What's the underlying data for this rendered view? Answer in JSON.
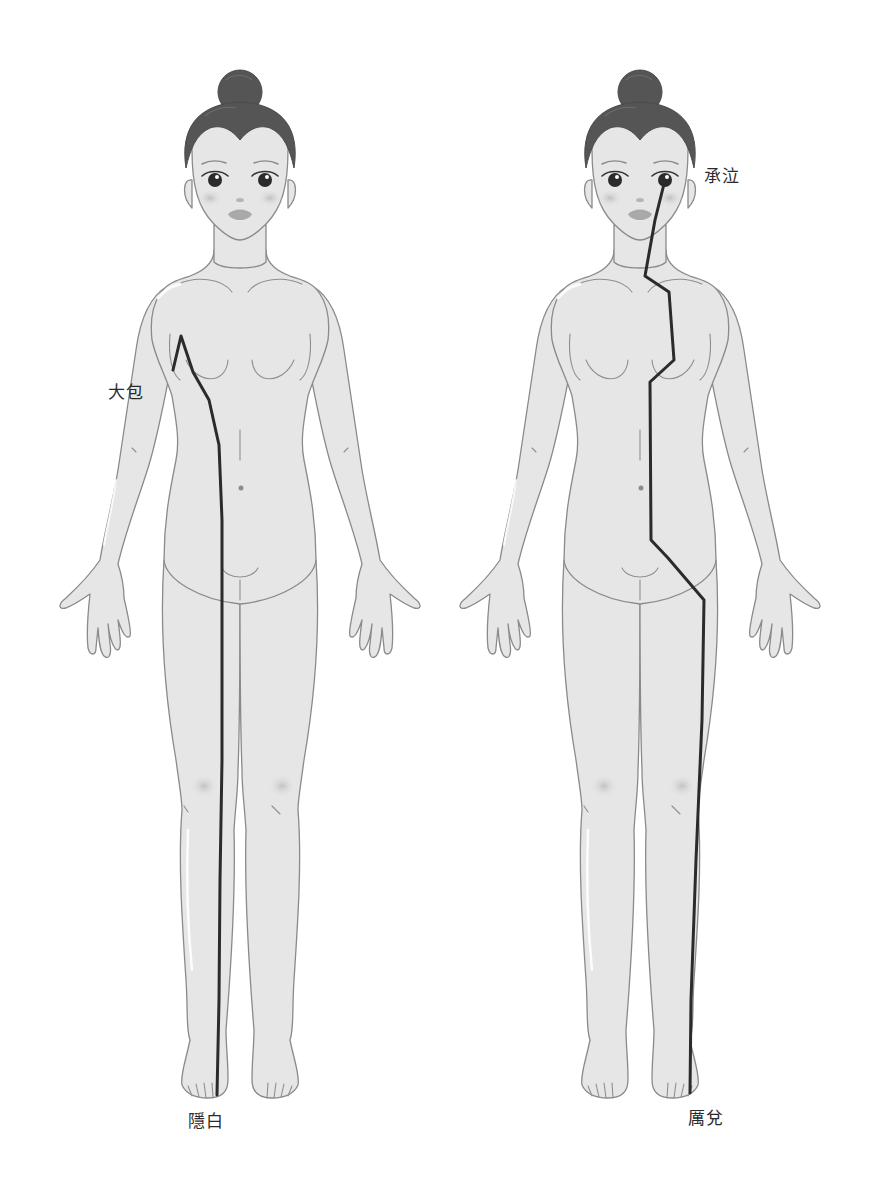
{
  "diagram": {
    "type": "acupuncture-meridian-figures",
    "background": "#ffffff",
    "skin_color": "#e6e6e6",
    "outline_color": "#8a8a8a",
    "hair_color": "#555555",
    "meridian_color": "#2b2b2b",
    "figures": [
      {
        "id": "left",
        "meridian_path_points": [
          [
            217,
            1095
          ],
          [
            219,
            1000
          ],
          [
            220,
            880
          ],
          [
            222,
            760
          ],
          [
            222,
            640
          ],
          [
            222,
            520
          ],
          [
            219,
            445
          ],
          [
            209,
            400
          ],
          [
            193,
            372
          ],
          [
            181,
            336
          ],
          [
            173,
            370
          ]
        ],
        "labels": {
          "top_point": "大包",
          "bottom_point": "隱白"
        }
      },
      {
        "id": "right",
        "meridian_path_points": [
          [
            664,
            184
          ],
          [
            655,
            220
          ],
          [
            645,
            276
          ],
          [
            669,
            292
          ],
          [
            674,
            360
          ],
          [
            650,
            382
          ],
          [
            651,
            540
          ],
          [
            668,
            558
          ],
          [
            704,
            600
          ],
          [
            702,
            720
          ],
          [
            696,
            860
          ],
          [
            691,
            1000
          ],
          [
            690,
            1093
          ]
        ],
        "labels": {
          "top_point": "承泣",
          "bottom_point": "厲兌"
        }
      }
    ]
  }
}
